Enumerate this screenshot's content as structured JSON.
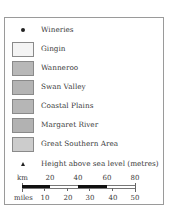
{
  "legend": {
    "wineries": {
      "label": "Wineries",
      "icon": "dot-icon"
    },
    "regions": [
      {
        "label": "Gingin",
        "color": "#f4f4f4"
      },
      {
        "label": "Wanneroo",
        "color": "#b8b8b8"
      },
      {
        "label": "Swan Valley",
        "color": "#b4b4b4"
      },
      {
        "label": "Coastal Plains",
        "color": "#b6b6b6"
      },
      {
        "label": "Margaret River",
        "color": "#b2b2b2"
      },
      {
        "label": "Great Southern Area",
        "color": "#cccccc"
      }
    ],
    "height": {
      "label": "Height above sea level (metres)",
      "icon": "triangle-icon"
    },
    "scale": {
      "km_label": "km",
      "km_ticks": [
        "20",
        "40",
        "60",
        "80"
      ],
      "miles_label": "miles",
      "mile_ticks": [
        "10",
        "20",
        "30",
        "40",
        "50"
      ]
    }
  }
}
